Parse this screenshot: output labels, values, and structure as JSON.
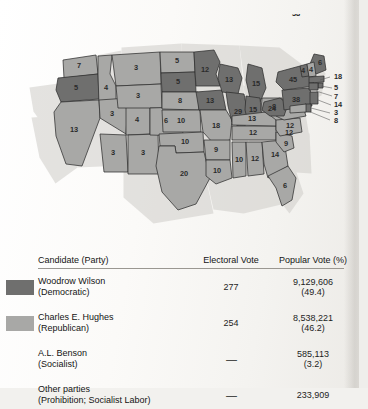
{
  "map": {
    "title": "Election of 1916 electoral map",
    "colors": {
      "wilson_fill": "#a8a8a6",
      "hughes_fill": "#6f6f6e",
      "outline": "#2f2f2f",
      "shadow": "#d8d6d2"
    },
    "states": [
      {
        "code": "WA",
        "ev": "7",
        "party": "wilson"
      },
      {
        "code": "OR",
        "ev": "5",
        "party": "hughes"
      },
      {
        "code": "CA",
        "ev": "13",
        "party": "wilson"
      },
      {
        "code": "NV",
        "ev": "3",
        "party": "wilson"
      },
      {
        "code": "ID",
        "ev": "4",
        "party": "wilson"
      },
      {
        "code": "MT",
        "ev": "3",
        "party": "wilson"
      },
      {
        "code": "WY",
        "ev": "3",
        "party": "wilson"
      },
      {
        "code": "UT",
        "ev": "4",
        "party": "wilson"
      },
      {
        "code": "AZ",
        "ev": "3",
        "party": "wilson"
      },
      {
        "code": "NM",
        "ev": "3",
        "party": "wilson"
      },
      {
        "code": "CO",
        "ev": "6",
        "party": "wilson"
      },
      {
        "code": "ND",
        "ev": "5",
        "party": "wilson"
      },
      {
        "code": "SD",
        "ev": "5",
        "party": "hughes"
      },
      {
        "code": "NE",
        "ev": "8",
        "party": "wilson"
      },
      {
        "code": "KS",
        "ev": "10",
        "party": "wilson"
      },
      {
        "code": "OK",
        "ev": "10",
        "party": "wilson"
      },
      {
        "code": "TX",
        "ev": "20",
        "party": "wilson"
      },
      {
        "code": "MN",
        "ev": "12",
        "party": "hughes"
      },
      {
        "code": "IA",
        "ev": "13",
        "party": "hughes"
      },
      {
        "code": "MO",
        "ev": "18",
        "party": "wilson"
      },
      {
        "code": "AR",
        "ev": "9",
        "party": "wilson"
      },
      {
        "code": "LA",
        "ev": "10",
        "party": "wilson"
      },
      {
        "code": "WI",
        "ev": "13",
        "party": "hughes"
      },
      {
        "code": "IL",
        "ev": "29",
        "party": "hughes"
      },
      {
        "code": "MS",
        "ev": "10",
        "party": "wilson"
      },
      {
        "code": "AL",
        "ev": "12",
        "party": "wilson"
      },
      {
        "code": "TN",
        "ev": "12",
        "party": "wilson"
      },
      {
        "code": "KY",
        "ev": "13",
        "party": "wilson"
      },
      {
        "code": "IN",
        "ev": "15",
        "party": "hughes"
      },
      {
        "code": "MI",
        "ev": "15",
        "party": "hughes"
      },
      {
        "code": "OH",
        "ev": "24",
        "party": "wilson"
      },
      {
        "code": "WV",
        "ev": "8",
        "party": "hughes"
      },
      {
        "code": "VA",
        "ev": "12",
        "party": "wilson"
      },
      {
        "code": "NC",
        "ev": "12",
        "party": "wilson"
      },
      {
        "code": "SC",
        "ev": "9",
        "party": "wilson"
      },
      {
        "code": "GA",
        "ev": "14",
        "party": "wilson"
      },
      {
        "code": "FL",
        "ev": "6",
        "party": "wilson"
      },
      {
        "code": "PA",
        "ev": "38",
        "party": "hughes"
      },
      {
        "code": "NY",
        "ev": "45",
        "party": "hughes"
      },
      {
        "code": "ME",
        "ev": "6",
        "party": "hughes"
      },
      {
        "code": "VT",
        "ev": "4",
        "party": "hughes"
      },
      {
        "code": "NH",
        "ev": "4",
        "party": "wilson"
      },
      {
        "code": "MA",
        "ev": "18",
        "party": "hughes"
      },
      {
        "code": "RI",
        "ev": "5",
        "party": "hughes"
      },
      {
        "code": "CT",
        "ev": "7",
        "party": "hughes"
      },
      {
        "code": "NJ",
        "ev": "14",
        "party": "hughes"
      },
      {
        "code": "DE",
        "ev": "3",
        "party": "hughes"
      },
      {
        "code": "MD",
        "ev": "8",
        "party": "wilson"
      }
    ]
  },
  "table": {
    "headers": {
      "candidate": "Candidate (Party)",
      "electoral": "Electoral Vote",
      "popular": "Popular Vote (%)"
    },
    "rows": [
      {
        "swatch": "#6f6f6e",
        "name": "Woodrow Wilson",
        "party": "(Democratic)",
        "electoral": "277",
        "popular": "9,129,606",
        "percent": "(49.4)"
      },
      {
        "swatch": "#a8a8a6",
        "name": "Charles E. Hughes",
        "party": "(Republican)",
        "electoral": "254",
        "popular": "8,538,221",
        "percent": "(46.2)"
      },
      {
        "swatch": "",
        "name": "A.L. Benson",
        "party": "(Socialist)",
        "electoral": "—",
        "popular": "585,113",
        "percent": "(3.2)"
      },
      {
        "swatch": "",
        "name": "Other parties",
        "party": "(Prohibition; Socialist Labor)",
        "electoral": "—",
        "popular": "233,909",
        "percent": ""
      }
    ]
  }
}
